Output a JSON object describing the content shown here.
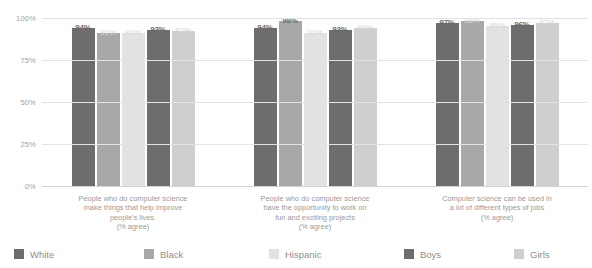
{
  "chart_data": {
    "type": "bar",
    "title": "",
    "subtitle": "",
    "xlabel": "",
    "ylabel": "",
    "ylim": [
      0,
      100
    ],
    "y_ticks": [
      "0%",
      "25%",
      "50%",
      "75%",
      "100%"
    ],
    "y_tick_values": [
      0,
      25,
      50,
      75,
      100
    ],
    "grid": true,
    "legend_position": "bottom",
    "categories": [
      "People who do computer science make things that help improve people's lives. (% agree)",
      "People who do computer science have the opportunity to work on fun and exciting projects (% agree)",
      "Computer science can be used in a lot of different types of jobs (% agree)"
    ],
    "category_lines": [
      [
        "People who do computer science",
        "make things that help improve",
        "people's lives.",
        "(% agree)"
      ],
      [
        "People who do computer science",
        "have the opportunity to work on",
        "fun and exciting projects",
        "(% agree)"
      ],
      [
        "Computer science can be used in",
        "a lot of different types of jobs",
        "(% agree)"
      ]
    ],
    "series": [
      {
        "name": "White",
        "color": "#6d6d6d",
        "values": [
          94,
          94,
          97
        ],
        "labels": [
          "94%",
          "94%",
          "97%"
        ]
      },
      {
        "name": "Black",
        "color": "#a8a8a8",
        "values": [
          91,
          98,
          98
        ],
        "labels": [
          "91%",
          "98%",
          "98%"
        ]
      },
      {
        "name": "Hispanic",
        "color": "#e2e2e2",
        "values": [
          91,
          91,
          95
        ],
        "labels": [
          "91%",
          "91%",
          "95%"
        ]
      },
      {
        "name": "Boys",
        "color": "#6d6d6d",
        "values": [
          93,
          93,
          96
        ],
        "labels": [
          "93%",
          "93%",
          "96%"
        ]
      },
      {
        "name": "Girls",
        "color": "#cfcfcf",
        "values": [
          92,
          94,
          97
        ],
        "labels": [
          "92%",
          "94%",
          "97%"
        ]
      }
    ],
    "label_styles": [
      [
        "strong",
        "faint",
        "faint",
        "strong",
        "faint"
      ],
      [
        "strong",
        "strong",
        "faint",
        "strong",
        "faint"
      ],
      [
        "strong",
        "faint",
        "faint",
        "strong",
        "faint"
      ]
    ]
  },
  "legend": {
    "items": [
      {
        "label": "White"
      },
      {
        "label": "Black"
      },
      {
        "label": "Hispanic"
      },
      {
        "label": "Boys"
      },
      {
        "label": "Girls"
      }
    ]
  }
}
